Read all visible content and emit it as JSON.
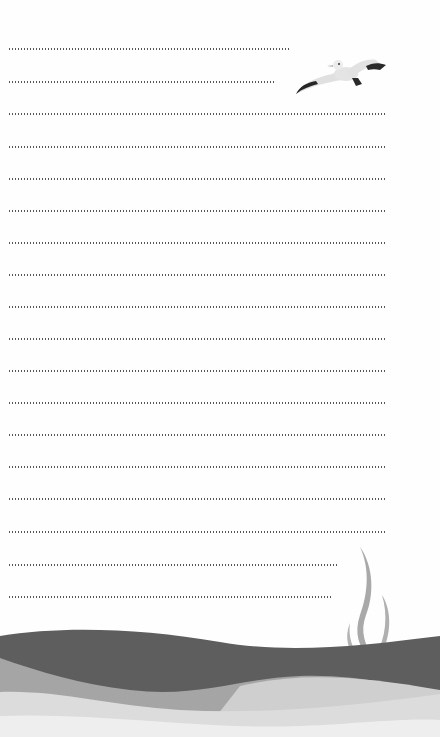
{
  "page": {
    "type": "lined-notepaper",
    "background": "#fefefe",
    "dot_color": "#555555"
  },
  "lines": [
    {
      "y": 49,
      "x_end": 290
    },
    {
      "y": 82,
      "x_end": 275
    },
    {
      "y": 114,
      "x_end": 387
    },
    {
      "y": 147,
      "x_end": 387
    },
    {
      "y": 179,
      "x_end": 387
    },
    {
      "y": 211,
      "x_end": 387
    },
    {
      "y": 243,
      "x_end": 387
    },
    {
      "y": 275,
      "x_end": 387
    },
    {
      "y": 307,
      "x_end": 387
    },
    {
      "y": 339,
      "x_end": 387
    },
    {
      "y": 371,
      "x_end": 387
    },
    {
      "y": 403,
      "x_end": 387
    },
    {
      "y": 435,
      "x_end": 387
    },
    {
      "y": 467,
      "x_end": 387
    },
    {
      "y": 499,
      "x_end": 387
    },
    {
      "y": 532,
      "x_end": 387
    },
    {
      "y": 565,
      "x_end": 337
    },
    {
      "y": 597,
      "x_end": 333
    }
  ],
  "decorations": {
    "seagull": {
      "icon": "seagull-icon",
      "body_color": "#e2e2e2",
      "wingtip_color": "#2a2a2a"
    },
    "seaweed": {
      "icon": "seaweed-icon",
      "color": "#a8a8a8"
    },
    "waves": {
      "dark": "#5e5e5e",
      "mid": "#a5a5a5",
      "light": "#d6d6d6",
      "lightest": "#eeeeee"
    }
  }
}
